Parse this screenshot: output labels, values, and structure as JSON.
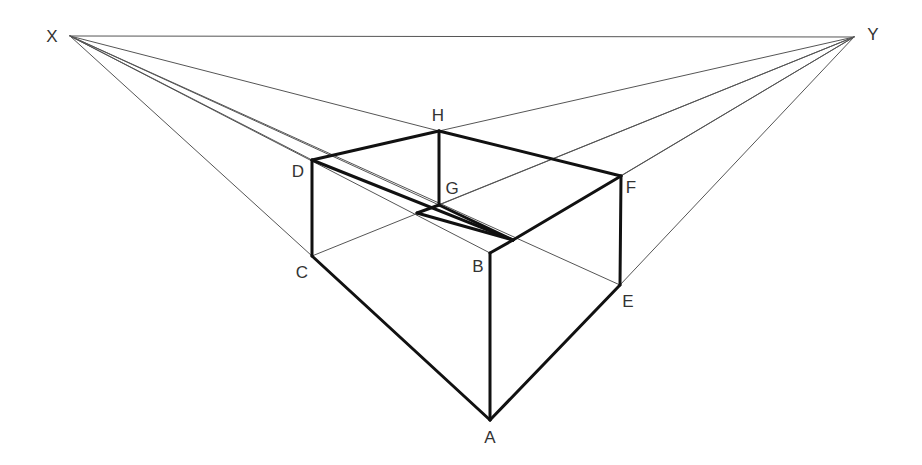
{
  "diagram": {
    "type": "two-point-perspective-box",
    "colors": {
      "background": "#ffffff",
      "thin_line": "#555555",
      "thick_line": "#111111",
      "label": "#333333"
    },
    "vanishing_points": [
      {
        "id": "X",
        "label": "X",
        "x": 70,
        "y": 36,
        "label_x": 52,
        "label_y": 36
      },
      {
        "id": "Y",
        "label": "Y",
        "x": 854,
        "y": 37,
        "label_x": 873,
        "label_y": 34
      }
    ],
    "vertices": [
      {
        "id": "A",
        "label": "A",
        "x": 490,
        "y": 420,
        "label_x": 490,
        "label_y": 437
      },
      {
        "id": "B",
        "label": "B",
        "x": 490,
        "y": 253,
        "label_x": 478,
        "label_y": 266
      },
      {
        "id": "C",
        "label": "C",
        "x": 312,
        "y": 256,
        "label_x": 302,
        "label_y": 272
      },
      {
        "id": "D",
        "label": "D",
        "x": 312,
        "y": 160,
        "label_x": 298,
        "label_y": 171
      },
      {
        "id": "E",
        "label": "E",
        "x": 620,
        "y": 285,
        "label_x": 628,
        "label_y": 301
      },
      {
        "id": "F",
        "label": "F",
        "x": 621,
        "y": 176,
        "label_x": 631,
        "label_y": 187
      },
      {
        "id": "G",
        "label": "G",
        "x": 439,
        "y": 205,
        "label_x": 452,
        "label_y": 188
      },
      {
        "id": "H",
        "label": "H",
        "x": 439,
        "y": 131,
        "label_x": 438,
        "label_y": 115
      }
    ],
    "thick_edges": [
      [
        "A",
        "B"
      ],
      [
        "A",
        "C"
      ],
      [
        "A",
        "E"
      ],
      [
        "C",
        "D"
      ],
      [
        "E",
        "F"
      ],
      [
        "G",
        "H"
      ],
      [
        "D",
        "H"
      ],
      [
        "H",
        "F"
      ],
      [
        "D",
        "B2"
      ],
      [
        "F",
        "B2"
      ],
      [
        "B",
        "B2"
      ],
      [
        "G",
        "G2"
      ],
      [
        "G2",
        "B2"
      ],
      [
        "G",
        "GE"
      ]
    ],
    "aux_points": [
      {
        "id": "B2",
        "x": 513,
        "y": 240
      },
      {
        "id": "G2",
        "x": 417,
        "y": 213
      },
      {
        "id": "GE",
        "x": 513,
        "y": 240
      }
    ],
    "construction_lines": [
      [
        "X",
        "Y"
      ],
      [
        "X",
        "H"
      ],
      [
        "X",
        "D"
      ],
      [
        "X",
        "C"
      ],
      [
        "X",
        "G"
      ],
      [
        "X",
        "E"
      ],
      [
        "X",
        "B"
      ],
      [
        "Y",
        "H"
      ],
      [
        "Y",
        "F"
      ],
      [
        "Y",
        "E"
      ],
      [
        "Y",
        "G"
      ],
      [
        "Y",
        "C"
      ],
      [
        "Y",
        "B2"
      ]
    ]
  }
}
